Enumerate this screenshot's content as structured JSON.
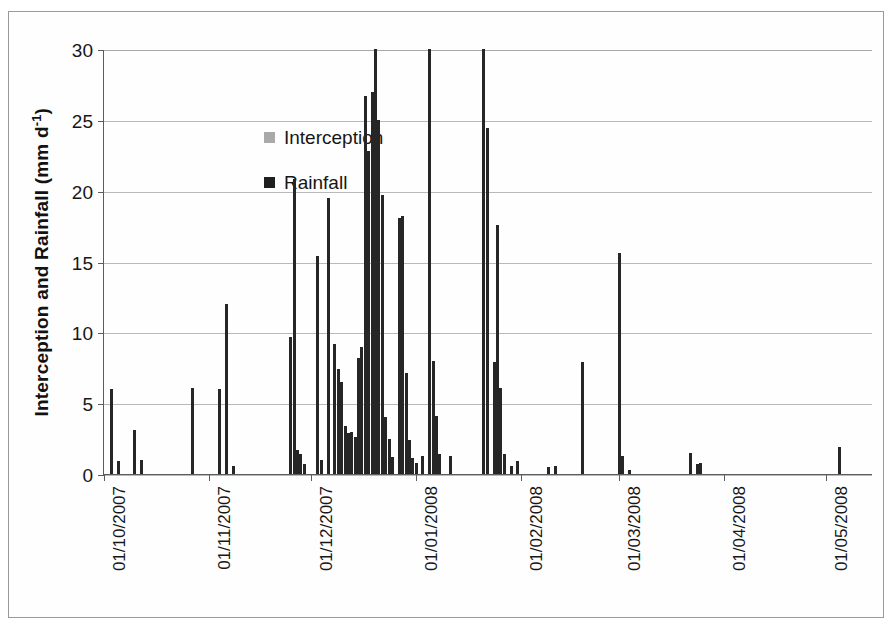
{
  "figure": {
    "y_axis_title_main": "Interception and Rainfall (mm d",
    "y_axis_title_exp": "-1",
    "y_axis_title_close": ")",
    "y_axis_title_plain": "Interception and Rainfall (mm d-1)"
  },
  "legend": {
    "position": "inside-top-left",
    "entries": [
      {
        "label": "Interception",
        "color": "#a9a9a9",
        "icon": "square-swatch-icon"
      },
      {
        "label": "Rainfall",
        "color": "#1f1f1f",
        "icon": "square-swatch-icon"
      }
    ]
  },
  "chart_data": {
    "type": "bar",
    "title": "",
    "subtitle": "",
    "xlabel": "",
    "ylabel": "Interception and Rainfall (mm d-1)",
    "ylim": [
      0,
      30
    ],
    "yticks": [
      0,
      5,
      10,
      15,
      20,
      25,
      30
    ],
    "ytick_labels": [
      "0",
      "5",
      "10",
      "15",
      "20",
      "25",
      "30"
    ],
    "grid": true,
    "grid_axis": "y",
    "legend_position": "inside top-left",
    "x_type": "date",
    "xlim": [
      "01/10/2007",
      "15/05/2008"
    ],
    "xtick_labels": [
      "01/10/2007",
      "01/11/2007",
      "01/12/2007",
      "01/01/2008",
      "01/02/2008",
      "01/03/2008",
      "01/04/2008",
      "01/05/2008"
    ],
    "xtick_positions_day": [
      0,
      31,
      61,
      92,
      123,
      152,
      183,
      213
    ],
    "x_total_days": 227,
    "series": [
      {
        "name": "Rainfall",
        "color": "#262626",
        "points": [
          {
            "day": 2,
            "value": 6.0
          },
          {
            "day": 4,
            "value": 0.9
          },
          {
            "day": 9,
            "value": 3.1
          },
          {
            "day": 11,
            "value": 1.0
          },
          {
            "day": 26,
            "value": 6.1
          },
          {
            "day": 36,
            "value": 12.0
          },
          {
            "day": 34,
            "value": 6.0
          },
          {
            "day": 38,
            "value": 0.6
          },
          {
            "day": 55,
            "value": 9.7
          },
          {
            "day": 57,
            "value": 1.7
          },
          {
            "day": 58,
            "value": 1.4
          },
          {
            "day": 59,
            "value": 0.7
          },
          {
            "day": 56,
            "value": 20.8
          },
          {
            "day": 63,
            "value": 15.4
          },
          {
            "day": 64,
            "value": 1.0
          },
          {
            "day": 66,
            "value": 19.5
          },
          {
            "day": 68,
            "value": 9.2
          },
          {
            "day": 69,
            "value": 7.4
          },
          {
            "day": 70,
            "value": 6.5
          },
          {
            "day": 71,
            "value": 3.4
          },
          {
            "day": 72,
            "value": 2.9
          },
          {
            "day": 73,
            "value": 3.0
          },
          {
            "day": 74,
            "value": 2.6
          },
          {
            "day": 75,
            "value": 8.2
          },
          {
            "day": 76,
            "value": 9.0
          },
          {
            "day": 77,
            "value": 26.7
          },
          {
            "day": 78,
            "value": 22.8
          },
          {
            "day": 79,
            "value": 27.0
          },
          {
            "day": 80,
            "value": 30.0
          },
          {
            "day": 81,
            "value": 25.0
          },
          {
            "day": 82,
            "value": 19.7
          },
          {
            "day": 83,
            "value": 4.0
          },
          {
            "day": 84,
            "value": 2.5
          },
          {
            "day": 85,
            "value": 1.2
          },
          {
            "day": 87,
            "value": 18.1
          },
          {
            "day": 88,
            "value": 18.2
          },
          {
            "day": 89,
            "value": 7.1
          },
          {
            "day": 90,
            "value": 2.4
          },
          {
            "day": 91,
            "value": 1.1
          },
          {
            "day": 92,
            "value": 0.8
          },
          {
            "day": 94,
            "value": 1.3
          },
          {
            "day": 96,
            "value": 30.0
          },
          {
            "day": 97,
            "value": 8.0
          },
          {
            "day": 98,
            "value": 4.1
          },
          {
            "day": 99,
            "value": 1.4
          },
          {
            "day": 102,
            "value": 1.3
          },
          {
            "day": 112,
            "value": 30.0
          },
          {
            "day": 113,
            "value": 24.4
          },
          {
            "day": 115,
            "value": 7.9
          },
          {
            "day": 116,
            "value": 17.6
          },
          {
            "day": 117,
            "value": 6.1
          },
          {
            "day": 118,
            "value": 1.4
          },
          {
            "day": 120,
            "value": 0.6
          },
          {
            "day": 122,
            "value": 0.9
          },
          {
            "day": 131,
            "value": 0.5
          },
          {
            "day": 133,
            "value": 0.6
          },
          {
            "day": 141,
            "value": 7.9
          },
          {
            "day": 152,
            "value": 15.6
          },
          {
            "day": 153,
            "value": 1.3
          },
          {
            "day": 155,
            "value": 0.3
          },
          {
            "day": 173,
            "value": 1.5
          },
          {
            "day": 175,
            "value": 0.7
          },
          {
            "day": 176,
            "value": 0.8
          },
          {
            "day": 217,
            "value": 1.9
          }
        ]
      },
      {
        "name": "Interception",
        "color": "#9d9d9d",
        "points": [
          {
            "day": 2,
            "value": 1.6
          },
          {
            "day": 9,
            "value": 0.9
          },
          {
            "day": 26,
            "value": 1.5
          },
          {
            "day": 36,
            "value": 2.2
          },
          {
            "day": 34,
            "value": 1.6
          },
          {
            "day": 55,
            "value": 2.0
          },
          {
            "day": 56,
            "value": 2.4
          },
          {
            "day": 63,
            "value": 2.2
          },
          {
            "day": 66,
            "value": 2.3
          },
          {
            "day": 68,
            "value": 1.9
          },
          {
            "day": 70,
            "value": 1.7
          },
          {
            "day": 75,
            "value": 2.0
          },
          {
            "day": 77,
            "value": 2.6
          },
          {
            "day": 79,
            "value": 2.6
          },
          {
            "day": 80,
            "value": 2.7
          },
          {
            "day": 81,
            "value": 2.5
          },
          {
            "day": 82,
            "value": 2.4
          },
          {
            "day": 87,
            "value": 2.3
          },
          {
            "day": 88,
            "value": 2.3
          },
          {
            "day": 96,
            "value": 2.5
          },
          {
            "day": 112,
            "value": 2.6
          },
          {
            "day": 113,
            "value": 2.5
          },
          {
            "day": 116,
            "value": 2.2
          },
          {
            "day": 141,
            "value": 1.8
          },
          {
            "day": 152,
            "value": 2.3
          }
        ]
      }
    ]
  }
}
